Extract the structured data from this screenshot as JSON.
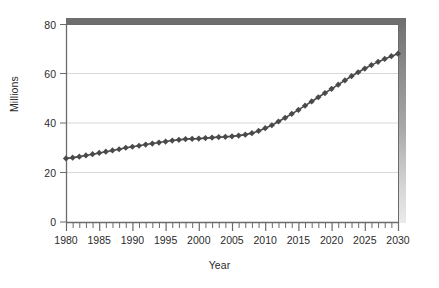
{
  "chart_data": {
    "type": "line",
    "title": "",
    "subtitle": "",
    "xlabel": "Year",
    "ylabel": "Millions",
    "xlim": [
      1980,
      2030
    ],
    "ylim": [
      0,
      80
    ],
    "yticks": [
      0,
      20,
      40,
      60,
      80
    ],
    "ytick_labels": [
      "0",
      "20",
      "40",
      "60",
      "80"
    ],
    "xticks": [
      1980,
      1985,
      1990,
      1995,
      2000,
      2005,
      2010,
      2015,
      2020,
      2025,
      2030
    ],
    "xtick_labels": [
      "1980",
      "1985",
      "1990",
      "1995",
      "2000",
      "2005",
      "2010",
      "2015",
      "2020",
      "2025",
      "2030"
    ],
    "x_minor_tick_step": 1,
    "grid": "horizontal",
    "legend": "none",
    "marker": "diamond",
    "line_color": "#4a4a4a",
    "marker_color": "#4a4a4a",
    "grid_color": "#d9d9d9",
    "axis_color": "#6b6b6b",
    "shadow_color": "#6e6e6e",
    "x": [
      1980,
      1981,
      1982,
      1983,
      1984,
      1985,
      1986,
      1987,
      1988,
      1989,
      1990,
      1991,
      1992,
      1993,
      1994,
      1995,
      1996,
      1997,
      1998,
      1999,
      2000,
      2001,
      2002,
      2003,
      2004,
      2005,
      2006,
      2007,
      2008,
      2009,
      2010,
      2011,
      2012,
      2013,
      2014,
      2015,
      2016,
      2017,
      2018,
      2019,
      2020,
      2021,
      2022,
      2023,
      2024,
      2025,
      2026,
      2027,
      2028,
      2029,
      2030
    ],
    "values": [
      25.7,
      26.0,
      26.4,
      26.9,
      27.4,
      27.9,
      28.4,
      28.9,
      29.4,
      30.0,
      30.4,
      30.8,
      31.3,
      31.7,
      32.1,
      32.5,
      32.9,
      33.2,
      33.5,
      33.6,
      33.7,
      33.9,
      34.1,
      34.3,
      34.4,
      34.6,
      34.9,
      35.3,
      35.9,
      36.8,
      37.9,
      39.1,
      40.6,
      42.1,
      43.7,
      45.3,
      47.0,
      48.7,
      50.4,
      52.1,
      53.8,
      55.5,
      57.2,
      58.9,
      60.5,
      62.0,
      63.4,
      64.7,
      65.9,
      67.0,
      68.0
    ]
  }
}
